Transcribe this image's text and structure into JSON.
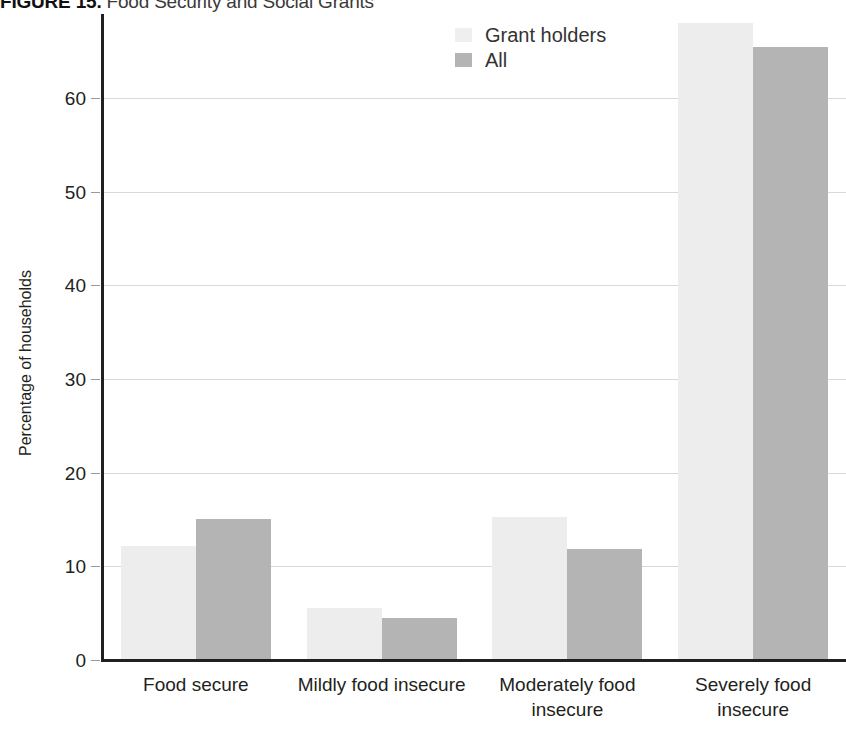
{
  "figure": {
    "label": "FIGURE 15.",
    "caption": " Food Security and Social Grants"
  },
  "axes": {
    "y_title": "Percentage of households",
    "y_ticks": [
      "0",
      "10",
      "20",
      "30",
      "40",
      "50",
      "60"
    ]
  },
  "legend": {
    "items": [
      {
        "label": "Grant holders",
        "swatch": "light",
        "color": "#ededed"
      },
      {
        "label": "All",
        "swatch": "dark",
        "color": "#b4b4b4"
      }
    ]
  },
  "chart_data": {
    "type": "bar",
    "title": "FIGURE 15. Food Security and Social Grants",
    "xlabel": "",
    "ylabel": "Percentage of households",
    "ylim": [
      0,
      70
    ],
    "yticks": [
      0,
      10,
      20,
      30,
      40,
      50,
      60
    ],
    "grid": true,
    "legend_position": "top-center",
    "categories": [
      "Food secure",
      "Mildly food insecure",
      "Moderately food insecure",
      "Severely food insecure"
    ],
    "category_lines": [
      [
        "Food secure"
      ],
      [
        "Mildly food insecure"
      ],
      [
        "Moderately food",
        "insecure"
      ],
      [
        "Severely food",
        "insecure"
      ]
    ],
    "series": [
      {
        "name": "Grant holders",
        "color": "#ededed",
        "values": [
          12.2,
          5.5,
          15.3,
          68.0
        ]
      },
      {
        "name": "All",
        "color": "#b4b4b4",
        "values": [
          15.0,
          4.5,
          11.8,
          65.4
        ]
      }
    ]
  }
}
